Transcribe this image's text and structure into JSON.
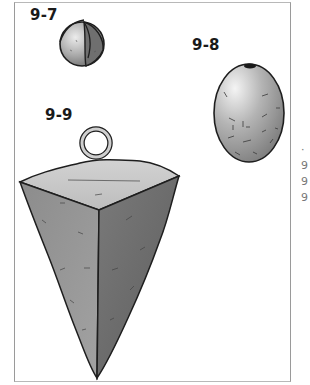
{
  "figure": {
    "items": [
      {
        "id": "9-7",
        "label": "9-7",
        "description": "round split sinker"
      },
      {
        "id": "9-8",
        "label": "9-8",
        "description": "egg sinker"
      },
      {
        "id": "9-9",
        "label": "9-9",
        "description": "pyramid sinker with ring"
      }
    ],
    "edge_fragments": [
      "·",
      "9",
      "9",
      "9"
    ]
  },
  "colors": {
    "panel_border": "#9a9a9a",
    "outline": "#1e1e1e",
    "light_gray": "#d6d6d6",
    "mid_gray": "#9c9c9c",
    "dark_gray": "#6e6e6e"
  }
}
